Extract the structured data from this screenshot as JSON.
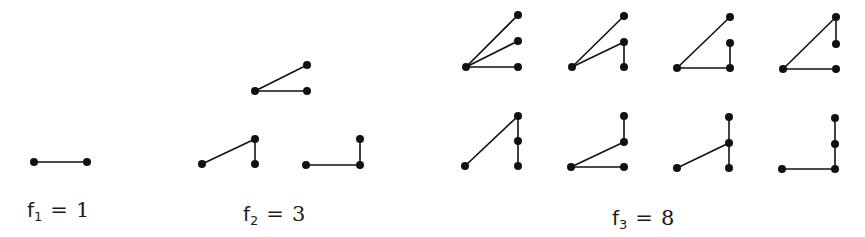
{
  "colors": {
    "ink": "#111111",
    "background": "#ffffff"
  },
  "groups": [
    {
      "id": "f1",
      "label": {
        "symbol": "f",
        "index": "1",
        "equals": "=",
        "value": "1",
        "x": 27,
        "y": 200
      },
      "graphs": [
        {
          "nodes": [
            [
              34,
              162
            ],
            [
              87,
              162
            ]
          ],
          "edges": [
            [
              0,
              1
            ]
          ]
        }
      ]
    },
    {
      "id": "f2",
      "label": {
        "symbol": "f",
        "index": "2",
        "equals": "=",
        "value": "3",
        "x": 243,
        "y": 204
      },
      "graphs": [
        {
          "nodes": [
            [
              255,
              91
            ],
            [
              307,
              65
            ],
            [
              307,
              91
            ]
          ],
          "edges": [
            [
              0,
              1
            ],
            [
              0,
              2
            ]
          ]
        },
        {
          "nodes": [
            [
              202,
              164
            ],
            [
              255,
              139
            ],
            [
              255,
              164
            ]
          ],
          "edges": [
            [
              0,
              1
            ],
            [
              1,
              2
            ]
          ]
        },
        {
          "nodes": [
            [
              306,
              165
            ],
            [
              360,
              139
            ],
            [
              360,
              165
            ]
          ],
          "edges": [
            [
              0,
              2
            ],
            [
              2,
              1
            ]
          ]
        }
      ]
    },
    {
      "id": "f3",
      "label": {
        "symbol": "f",
        "index": "3",
        "equals": "=",
        "value": "8",
        "x": 612,
        "y": 208
      },
      "graphs": [
        {
          "nodes": [
            [
              466,
              67
            ],
            [
              518,
              15
            ],
            [
              518,
              41
            ],
            [
              518,
              67
            ]
          ],
          "edges": [
            [
              0,
              1
            ],
            [
              0,
              2
            ],
            [
              0,
              3
            ]
          ]
        },
        {
          "nodes": [
            [
              572,
              67
            ],
            [
              624,
              16
            ],
            [
              624,
              42
            ],
            [
              624,
              67
            ]
          ],
          "edges": [
            [
              0,
              1
            ],
            [
              0,
              2
            ],
            [
              2,
              3
            ]
          ]
        },
        {
          "nodes": [
            [
              677,
              68
            ],
            [
              730,
              17
            ],
            [
              730,
              43
            ],
            [
              730,
              68
            ]
          ],
          "edges": [
            [
              0,
              1
            ],
            [
              0,
              3
            ],
            [
              3,
              2
            ]
          ]
        },
        {
          "nodes": [
            [
              783,
              69
            ],
            [
              836,
              17
            ],
            [
              836,
              44
            ],
            [
              836,
              69
            ]
          ],
          "edges": [
            [
              0,
              1
            ],
            [
              1,
              2
            ],
            [
              0,
              3
            ]
          ]
        },
        {
          "nodes": [
            [
              465,
              166
            ],
            [
              518,
              116
            ],
            [
              518,
              141
            ],
            [
              518,
              166
            ]
          ],
          "edges": [
            [
              0,
              1
            ],
            [
              1,
              2
            ],
            [
              2,
              3
            ]
          ]
        },
        {
          "nodes": [
            [
              571,
              167
            ],
            [
              624,
              116
            ],
            [
              624,
              142
            ],
            [
              624,
              167
            ]
          ],
          "edges": [
            [
              0,
              2
            ],
            [
              2,
              1
            ],
            [
              0,
              3
            ]
          ]
        },
        {
          "nodes": [
            [
              677,
              168
            ],
            [
              729,
              117
            ],
            [
              729,
              143
            ],
            [
              729,
              168
            ]
          ],
          "edges": [
            [
              0,
              2
            ],
            [
              2,
              1
            ],
            [
              2,
              3
            ]
          ]
        },
        {
          "nodes": [
            [
              782,
              169
            ],
            [
              835,
              118
            ],
            [
              835,
              144
            ],
            [
              835,
              169
            ]
          ],
          "edges": [
            [
              0,
              3
            ],
            [
              3,
              2
            ],
            [
              2,
              1
            ]
          ]
        }
      ]
    }
  ]
}
